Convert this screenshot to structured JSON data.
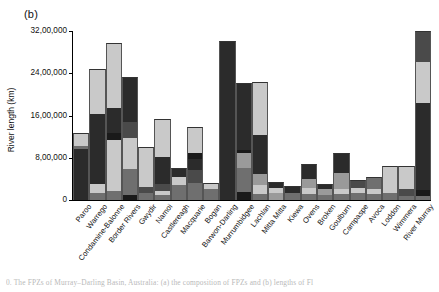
{
  "figure": {
    "panel_label": "(b)",
    "caption": "0.   The  FPZs   of Murray–Darling Basin,  Australia:  (a) the composition of FPZs and  (b) lengths of Fl"
  },
  "chart_data": {
    "type": "bar",
    "stacked": true,
    "title": "",
    "xlabel": "",
    "ylabel": "River length (km)",
    "ylim": [
      0,
      3200000
    ],
    "yticks": [
      0,
      800000,
      1600000,
      2400000,
      3200000
    ],
    "ytick_labels": [
      "0",
      "8,00,000",
      "16,00,000",
      "24,00,000",
      "32,00,000"
    ],
    "grid": false,
    "legend": "none",
    "axis_number_format": "indian-lakh",
    "colors": [
      "#2b2b2b",
      "#6f6f6f",
      "#4a4a4a",
      "#1a1a1a",
      "#9a9a9a",
      "#c9c9c9"
    ],
    "series": [
      {
        "name": "FPZ 1",
        "color": "#2b2b2b"
      },
      {
        "name": "FPZ 2",
        "color": "#6f6f6f"
      },
      {
        "name": "FPZ 3",
        "color": "#4a4a4a"
      },
      {
        "name": "FPZ 4",
        "color": "#1a1a1a"
      },
      {
        "name": "FPZ 5",
        "color": "#9a9a9a"
      },
      {
        "name": "FPZ 6",
        "color": "#c9c9c9"
      }
    ],
    "categories": [
      "Paroo",
      "Warrego",
      "Condamine-Balonne",
      "Border Rivers",
      "Gwydir",
      "Namoi",
      "Castlereagh",
      "Macquarie",
      "Bogan",
      "Barwon-Darling",
      "Murrumbidgee",
      "Lachlan",
      "Mitta Mitta",
      "Kiewa",
      "Ovens",
      "Broken",
      "Goulburn",
      "Campaspe",
      "Avoca",
      "Loddon",
      "Wimmera",
      "River Murray"
    ],
    "bars": [
      {
        "category": "Paroo",
        "total": 1270000,
        "segments": [
          {
            "value": 960000,
            "color": "#2b2b2b"
          },
          {
            "value": 60000,
            "color": "#6f6f6f"
          },
          {
            "value": 250000,
            "color": "#c9c9c9"
          }
        ]
      },
      {
        "category": "Warrego",
        "total": 2480000,
        "segments": [
          {
            "value": 130000,
            "color": "#6f6f6f"
          },
          {
            "value": 170000,
            "color": "#c9c9c9"
          },
          {
            "value": 1330000,
            "color": "#2b2b2b"
          },
          {
            "value": 850000,
            "color": "#c9c9c9"
          }
        ]
      },
      {
        "category": "Condamine-Balonne",
        "total": 2970000,
        "segments": [
          {
            "value": 170000,
            "color": "#6f6f6f"
          },
          {
            "value": 260000,
            "color": "#c9c9c9"
          },
          {
            "value": 700000,
            "color": "#c9c9c9"
          },
          {
            "value": 140000,
            "color": "#1a1a1a"
          },
          {
            "value": 480000,
            "color": "#2b2b2b"
          },
          {
            "value": 1220000,
            "color": "#c9c9c9"
          }
        ]
      },
      {
        "category": "Border Rivers",
        "total": 2330000,
        "segments": [
          {
            "value": 100000,
            "color": "#1a1a1a"
          },
          {
            "value": 490000,
            "color": "#6f6f6f"
          },
          {
            "value": 590000,
            "color": "#c9c9c9"
          },
          {
            "value": 300000,
            "color": "#4a4a4a"
          },
          {
            "value": 850000,
            "color": "#2b2b2b"
          }
        ]
      },
      {
        "category": "Gwydir",
        "total": 1000000,
        "segments": [
          {
            "value": 130000,
            "color": "#6f6f6f"
          },
          {
            "value": 110000,
            "color": "#4a4a4a"
          },
          {
            "value": 760000,
            "color": "#c9c9c9"
          }
        ]
      },
      {
        "category": "Namoi",
        "total": 1530000,
        "segments": [
          {
            "value": 90000,
            "color": "#6f6f6f"
          },
          {
            "value": 90000,
            "color": "#c9c9c9"
          },
          {
            "value": 120000,
            "color": "#4a4a4a"
          },
          {
            "value": 520000,
            "color": "#2b2b2b"
          },
          {
            "value": 710000,
            "color": "#c9c9c9"
          }
        ]
      },
      {
        "category": "Castlereagh",
        "total": 600000,
        "segments": [
          {
            "value": 280000,
            "color": "#6f6f6f"
          },
          {
            "value": 150000,
            "color": "#c9c9c9"
          },
          {
            "value": 170000,
            "color": "#2b2b2b"
          }
        ]
      },
      {
        "category": "Macquarie",
        "total": 1390000,
        "segments": [
          {
            "value": 320000,
            "color": "#6f6f6f"
          },
          {
            "value": 240000,
            "color": "#4a4a4a"
          },
          {
            "value": 210000,
            "color": "#2b2b2b"
          },
          {
            "value": 120000,
            "color": "#1a1a1a"
          },
          {
            "value": 500000,
            "color": "#c9c9c9"
          }
        ]
      },
      {
        "category": "Bogan",
        "total": 330000,
        "segments": [
          {
            "value": 210000,
            "color": "#6f6f6f"
          },
          {
            "value": 120000,
            "color": "#c9c9c9"
          }
        ]
      },
      {
        "category": "Barwon-Darling",
        "total": 3020000,
        "segments": [
          {
            "value": 3020000,
            "color": "#2b2b2b"
          }
        ]
      },
      {
        "category": "Murrumbidgee",
        "total": 2210000,
        "segments": [
          {
            "value": 160000,
            "color": "#1a1a1a"
          },
          {
            "value": 440000,
            "color": "#6f6f6f"
          },
          {
            "value": 290000,
            "color": "#9a9a9a"
          },
          {
            "value": 60000,
            "color": "#1a1a1a"
          },
          {
            "value": 1260000,
            "color": "#2b2b2b"
          }
        ]
      },
      {
        "category": "Lachlan",
        "total": 2230000,
        "segments": [
          {
            "value": 110000,
            "color": "#6f6f6f"
          },
          {
            "value": 180000,
            "color": "#c9c9c9"
          },
          {
            "value": 200000,
            "color": "#9a9a9a"
          },
          {
            "value": 740000,
            "color": "#2b2b2b"
          },
          {
            "value": 1000000,
            "color": "#c9c9c9"
          }
        ]
      },
      {
        "category": "Mitta Mitta",
        "total": 350000,
        "segments": [
          {
            "value": 140000,
            "color": "#9a9a9a"
          },
          {
            "value": 80000,
            "color": "#c9c9c9"
          },
          {
            "value": 130000,
            "color": "#2b2b2b"
          }
        ]
      },
      {
        "category": "Kiewa",
        "total": 260000,
        "segments": [
          {
            "value": 140000,
            "color": "#6f6f6f"
          },
          {
            "value": 120000,
            "color": "#2b2b2b"
          }
        ]
      },
      {
        "category": "Ovens",
        "total": 680000,
        "segments": [
          {
            "value": 120000,
            "color": "#6f6f6f"
          },
          {
            "value": 100000,
            "color": "#c9c9c9"
          },
          {
            "value": 170000,
            "color": "#9a9a9a"
          },
          {
            "value": 290000,
            "color": "#2b2b2b"
          }
        ]
      },
      {
        "category": "Broken",
        "total": 300000,
        "segments": [
          {
            "value": 90000,
            "color": "#6f6f6f"
          },
          {
            "value": 110000,
            "color": "#9a9a9a"
          },
          {
            "value": 100000,
            "color": "#2b2b2b"
          }
        ]
      },
      {
        "category": "Goulburn",
        "total": 900000,
        "segments": [
          {
            "value": 110000,
            "color": "#6f6f6f"
          },
          {
            "value": 90000,
            "color": "#c9c9c9"
          },
          {
            "value": 320000,
            "color": "#9a9a9a"
          },
          {
            "value": 380000,
            "color": "#2b2b2b"
          }
        ]
      },
      {
        "category": "Campaspe",
        "total": 370000,
        "segments": [
          {
            "value": 130000,
            "color": "#6f6f6f"
          },
          {
            "value": 90000,
            "color": "#c9c9c9"
          },
          {
            "value": 150000,
            "color": "#4a4a4a"
          }
        ]
      },
      {
        "category": "Avoca",
        "total": 430000,
        "segments": [
          {
            "value": 120000,
            "color": "#6f6f6f"
          },
          {
            "value": 90000,
            "color": "#c9c9c9"
          },
          {
            "value": 220000,
            "color": "#6f6f6f"
          }
        ]
      },
      {
        "category": "Loddon",
        "total": 640000,
        "segments": [
          {
            "value": 130000,
            "color": "#6f6f6f"
          },
          {
            "value": 110000,
            "color": "#c9c9c9"
          },
          {
            "value": 400000,
            "color": "#c9c9c9"
          }
        ]
      },
      {
        "category": "Wimmera",
        "total": 640000,
        "segments": [
          {
            "value": 80000,
            "color": "#6f6f6f"
          },
          {
            "value": 130000,
            "color": "#4a4a4a"
          },
          {
            "value": 430000,
            "color": "#c9c9c9"
          }
        ]
      },
      {
        "category": "River Murray",
        "total": 3200000,
        "segments": [
          {
            "value": 70000,
            "color": "#6f6f6f"
          },
          {
            "value": 120000,
            "color": "#1a1a1a"
          },
          {
            "value": 1640000,
            "color": "#2b2b2b"
          },
          {
            "value": 790000,
            "color": "#c9c9c9"
          },
          {
            "value": 580000,
            "color": "#4a4a4a"
          }
        ]
      }
    ]
  }
}
